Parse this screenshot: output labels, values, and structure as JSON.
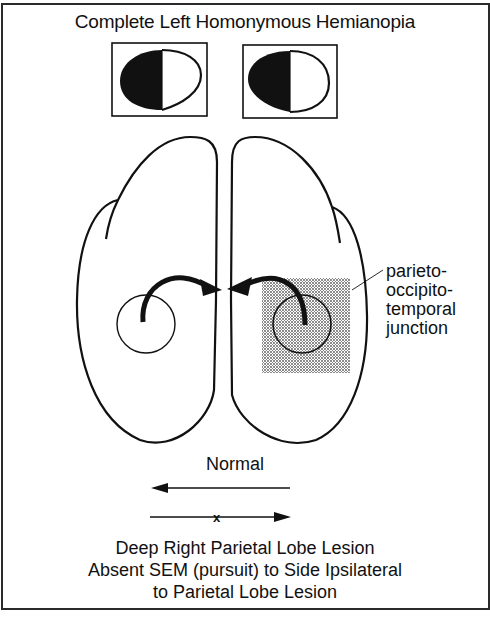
{
  "figure": {
    "title": "Complete Left Homonymous Hemianopia",
    "visual_fields": [
      {
        "eye": "left",
        "blind_half": "left",
        "description": "left half of visual field blacked out"
      },
      {
        "eye": "right",
        "blind_half": "left",
        "description": "left half of visual field blacked out"
      }
    ],
    "brain": {
      "hemispheres": [
        "left",
        "right"
      ],
      "lesion_label_lines": [
        "parieto-",
        "occipito-",
        "temporal",
        "junction"
      ],
      "lesion_side": "right",
      "arrows": "curved arrows from each parieto-occipito-temporal region toward midline"
    },
    "pursuit": {
      "normal_label": "Normal",
      "normal_direction": "left",
      "impaired_direction": "right",
      "impaired_marker": "x"
    },
    "caption_lines": [
      "Deep Right Parietal Lobe Lesion",
      "Absent SEM (pursuit) to Side Ipsilateral",
      "to Parietal Lobe Lesion"
    ],
    "colors": {
      "ink": "#111111",
      "paper": "#ffffff",
      "stipple": "#555555"
    }
  }
}
